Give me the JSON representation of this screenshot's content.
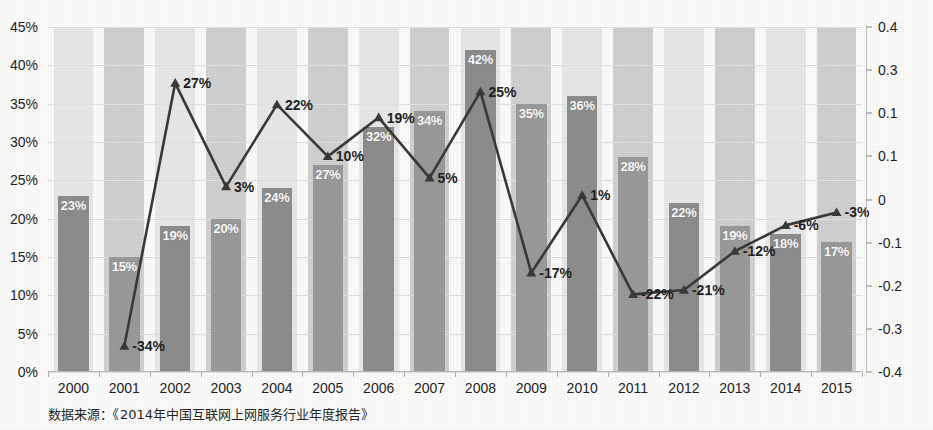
{
  "chart_data": {
    "type": "bar",
    "title": "",
    "subtitle": "",
    "xlabel": "",
    "ylabel": "",
    "categories": [
      "2000",
      "2001",
      "2002",
      "2003",
      "2004",
      "2005",
      "2006",
      "2007",
      "2008",
      "2009",
      "2010",
      "2011",
      "2012",
      "2013",
      "2014",
      "2015"
    ],
    "grid": true,
    "legend_position": "none",
    "axes": {
      "left": {
        "label": "",
        "ylim": [
          0,
          0.45
        ],
        "ticks": [
          "0%",
          "5%",
          "10%",
          "15%",
          "20%",
          "25%",
          "30%",
          "35%",
          "40%",
          "45%"
        ],
        "tick_values": [
          0,
          0.05,
          0.1,
          0.15,
          0.2,
          0.25,
          0.3,
          0.35,
          0.4,
          0.45
        ]
      },
      "right": {
        "label": "",
        "ylim": [
          -0.4,
          0.4
        ],
        "ticks": [
          "0.4",
          "0.3",
          "0.1",
          "0.1",
          "0",
          "-0.1",
          "-0.2",
          "-0.3",
          "-0.4"
        ],
        "tick_values": [
          0.4,
          0.3,
          0.2,
          0.1,
          0,
          -0.1,
          -0.2,
          -0.3,
          -0.4
        ]
      }
    },
    "series": [
      {
        "name": "bars",
        "chart_type": "bar",
        "axis": "left",
        "color": "#8e8e8e",
        "values": [
          0.23,
          0.15,
          0.19,
          0.2,
          0.24,
          0.27,
          0.32,
          0.34,
          0.42,
          0.35,
          0.36,
          0.28,
          0.22,
          0.19,
          0.18,
          0.17
        ],
        "labels": [
          "23%",
          "15%",
          "19%",
          "20%",
          "24%",
          "27%",
          "32%",
          "34%",
          "42%",
          "35%",
          "36%",
          "28%",
          "22%",
          "19%",
          "18%",
          "17%"
        ]
      },
      {
        "name": "line",
        "chart_type": "line",
        "axis": "right",
        "color": "#3a3a3a",
        "marker": "triangle",
        "values": [
          null,
          -0.34,
          0.27,
          0.03,
          0.22,
          0.1,
          0.19,
          0.05,
          0.25,
          -0.17,
          0.01,
          -0.22,
          -0.21,
          -0.12,
          -0.06,
          -0.03
        ],
        "labels": [
          "",
          "-34%",
          "27%",
          "3%",
          "22%",
          "10%",
          "19%",
          "5%",
          "25%",
          "-17%",
          "1%",
          "-22%",
          "-21%",
          "-12%",
          "-6%",
          "-3%"
        ]
      }
    ],
    "annotations": []
  },
  "footer": {
    "source_note": "数据来源：《2014年中国互联网上网服务行业年度报告》"
  },
  "colors": {
    "bar": "#8e8e8e",
    "bar_alt": "#9b9b9b",
    "line": "#3a3a3a",
    "band_light": "#e9e9e9",
    "band_dark": "#d2d2d2",
    "text": "#1f1f1f",
    "background": "#fdfdfc"
  }
}
